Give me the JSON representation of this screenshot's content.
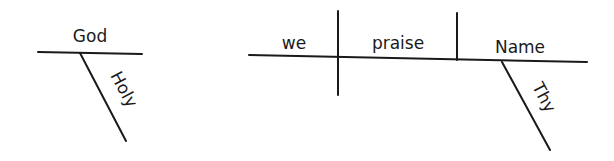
{
  "diagrams": [
    {
      "id": "phrase-1",
      "baseline_word": "God",
      "modifiers": [
        {
          "word": "Holy",
          "role": "adjective"
        }
      ]
    },
    {
      "id": "clause-1",
      "subject": "we",
      "verb": "praise",
      "direct_object": "Name",
      "modifiers": [
        {
          "word": "Thy",
          "role": "possessive",
          "modifies": "Name"
        }
      ]
    }
  ],
  "colors": {
    "ink": "#1a1a1a",
    "background": "#ffffff"
  }
}
